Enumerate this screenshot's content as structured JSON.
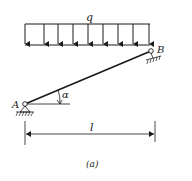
{
  "diagram": {
    "load_label": "q",
    "support_a_label": "A",
    "support_b_label": "B",
    "angle_label": "α",
    "span_label": "l",
    "caption": "(a)",
    "line_color": "#1a1a1a"
  }
}
